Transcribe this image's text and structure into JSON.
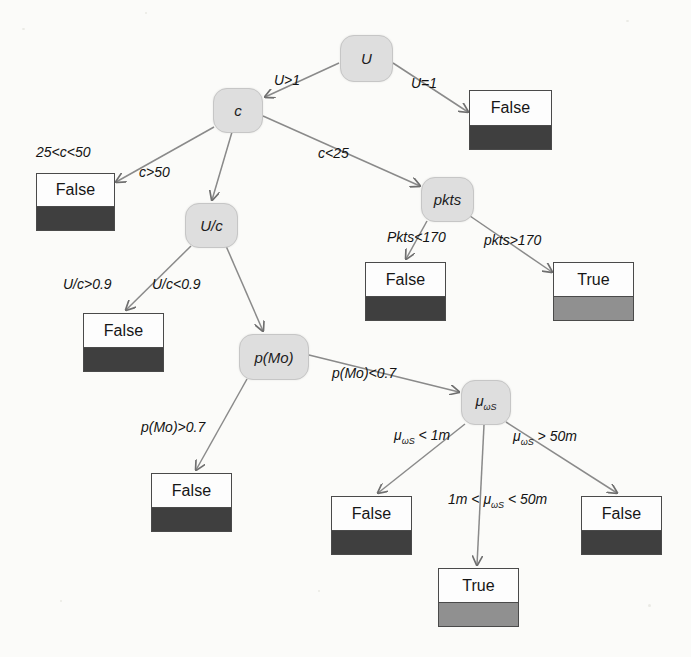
{
  "diagram": {
    "type": "decision-tree",
    "background_color": "#fbfbf9",
    "node_fill": "#dedede",
    "false_band_color": "#3f3f3f",
    "true_band_color": "#909090",
    "nodes": [
      {
        "id": "U",
        "label": "U",
        "x": 340,
        "y": 35,
        "w": 53,
        "h": 47
      },
      {
        "id": "c",
        "label": "c",
        "x": 213,
        "y": 88,
        "w": 50,
        "h": 45
      },
      {
        "id": "pkts",
        "label": "pkts",
        "x": 421,
        "y": 177,
        "w": 53,
        "h": 45
      },
      {
        "id": "Uc",
        "label": "U/c",
        "x": 185,
        "y": 203,
        "w": 53,
        "h": 45
      },
      {
        "id": "pMo",
        "label": "p(Mo)",
        "x": 239,
        "y": 334,
        "w": 70,
        "h": 46
      },
      {
        "id": "muwS",
        "label": "μ",
        "label_sub": "ωS",
        "x": 461,
        "y": 380,
        "w": 50,
        "h": 45
      }
    ],
    "leaves": [
      {
        "id": "leaf_U_eq1",
        "text": "False",
        "kind": "false",
        "x": 469,
        "y": 90,
        "w": 83,
        "h": 60
      },
      {
        "id": "leaf_c_25_50",
        "text": "False",
        "kind": "false",
        "x": 36,
        "y": 173,
        "w": 79,
        "h": 58
      },
      {
        "id": "leaf_pkts_lt170",
        "text": "False",
        "kind": "false",
        "x": 365,
        "y": 262,
        "w": 81,
        "h": 59
      },
      {
        "id": "leaf_pkts_gt170",
        "text": "True",
        "kind": "true",
        "x": 553,
        "y": 262,
        "w": 81,
        "h": 59
      },
      {
        "id": "leaf_Uc_gt09",
        "text": "False",
        "kind": "false",
        "x": 83,
        "y": 313,
        "w": 81,
        "h": 59
      },
      {
        "id": "leaf_pMo_gt07",
        "text": "False",
        "kind": "false",
        "x": 151,
        "y": 473,
        "w": 81,
        "h": 59
      },
      {
        "id": "leaf_mu_lt1m",
        "text": "False",
        "kind": "false",
        "x": 331,
        "y": 496,
        "w": 81,
        "h": 59
      },
      {
        "id": "leaf_mu_gt50m",
        "text": "False",
        "kind": "false",
        "x": 581,
        "y": 496,
        "w": 81,
        "h": 59
      },
      {
        "id": "leaf_mu_mid",
        "text": "True",
        "kind": "true",
        "x": 438,
        "y": 568,
        "w": 81,
        "h": 59
      }
    ],
    "edges": [
      {
        "id": "e_U_c",
        "from": "U",
        "to": "c",
        "label": "U>1",
        "lx": 274,
        "ly": 73,
        "x1": 339,
        "y1": 63,
        "x2": 265,
        "y2": 97
      },
      {
        "id": "e_U_false",
        "from": "U",
        "to": "leaf_U_eq1",
        "label": "U=1",
        "lx": 411,
        "ly": 76,
        "x1": 393,
        "y1": 63,
        "x2": 468,
        "y2": 112
      },
      {
        "id": "e_c_25_50",
        "from": "c",
        "to": "leaf_c_25_50",
        "label": "25<c<50",
        "lx": 36,
        "ly": 145,
        "x1": 214,
        "y1": 127,
        "x2": 116,
        "y2": 182
      },
      {
        "id": "e_c_gt50",
        "from": "c",
        "to": "Uc",
        "label": "c>50",
        "lx": 139,
        "ly": 165,
        "x1": 232,
        "y1": 132,
        "x2": 212,
        "y2": 200
      },
      {
        "id": "e_c_lt25",
        "from": "c",
        "to": "pkts",
        "label": "c<25",
        "lx": 318,
        "ly": 146,
        "x1": 263,
        "y1": 116,
        "x2": 420,
        "y2": 186
      },
      {
        "id": "e_pkts_lt170",
        "from": "pkts",
        "to": "leaf_pkts_lt170",
        "label": "Pkts<170",
        "lx": 387,
        "ly": 230,
        "x1": 427,
        "y1": 221,
        "x2": 406,
        "y2": 259
      },
      {
        "id": "e_pkts_gt170",
        "from": "pkts",
        "to": "leaf_pkts_gt170",
        "label": "pkts>170",
        "lx": 484,
        "ly": 233,
        "x1": 470,
        "y1": 216,
        "x2": 552,
        "y2": 272
      },
      {
        "id": "e_Uc_gt09",
        "from": "Uc",
        "to": "leaf_Uc_gt09",
        "label": "U/c>0.9",
        "lx": 63,
        "ly": 277,
        "x1": 191,
        "y1": 246,
        "x2": 126,
        "y2": 310
      },
      {
        "id": "e_Uc_lt09",
        "from": "Uc",
        "to": "pMo",
        "label": "U/c<0.9",
        "lx": 152,
        "ly": 277,
        "x1": 226,
        "y1": 246,
        "x2": 263,
        "y2": 331
      },
      {
        "id": "e_pMo_gt07",
        "from": "pMo",
        "to": "leaf_pMo_gt07",
        "label": "p(Mo)>0.7",
        "lx": 141,
        "ly": 420,
        "x1": 247,
        "y1": 379,
        "x2": 196,
        "y2": 470
      },
      {
        "id": "e_pMo_lt07",
        "from": "pMo",
        "to": "muwS",
        "label": "p(Mo)<0.7",
        "lx": 332,
        "ly": 366,
        "x1": 309,
        "y1": 355,
        "x2": 459,
        "y2": 392
      },
      {
        "id": "e_mu_lt1m",
        "from": "muwS",
        "to": "leaf_mu_lt1m",
        "label": "μωS < 1m",
        "lx": 394,
        "ly": 428,
        "x1": 465,
        "y1": 424,
        "x2": 378,
        "y2": 493
      },
      {
        "id": "e_mu_mid",
        "from": "muwS",
        "to": "leaf_mu_mid",
        "label": "1m < μωS < 50m",
        "lx": 448,
        "ly": 492,
        "x1": 484,
        "y1": 425,
        "x2": 477,
        "y2": 565
      },
      {
        "id": "e_mu_gt50m",
        "from": "muwS",
        "to": "leaf_mu_gt50m",
        "label": "μωS > 50m",
        "lx": 513,
        "ly": 429,
        "x1": 506,
        "y1": 422,
        "x2": 617,
        "y2": 493
      }
    ]
  }
}
